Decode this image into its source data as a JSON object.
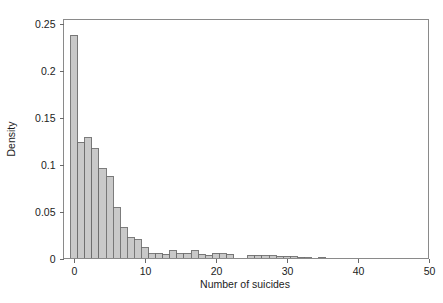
{
  "chart_data": {
    "type": "bar",
    "title": "",
    "subtitle": "",
    "xlabel": "Number of suicides",
    "ylabel": "Density",
    "xlim": [
      -1.5,
      50
    ],
    "ylim": [
      0,
      0.255
    ],
    "xticks": [
      0,
      10,
      20,
      30,
      40,
      50
    ],
    "xtick_labels": [
      "0",
      "10",
      "20",
      "30",
      "40",
      "50"
    ],
    "yticks": [
      0,
      0.05,
      0.1,
      0.15,
      0.2,
      0.25
    ],
    "ytick_labels": [
      "0",
      "0.05",
      "0.1",
      "0.15",
      "0.2",
      "0.25"
    ],
    "grid": false,
    "legend": null,
    "bin_width": 1,
    "bar_fill": "#c9c9c9",
    "bar_stroke": "#6e6e6e",
    "frame_color": "#8a8a8a",
    "categories": [
      0,
      1,
      2,
      3,
      4,
      5,
      6,
      7,
      8,
      9,
      10,
      11,
      12,
      13,
      14,
      15,
      16,
      17,
      18,
      19,
      20,
      21,
      22,
      23,
      24,
      25,
      26,
      27,
      28,
      29,
      30,
      31,
      32,
      33,
      34,
      35,
      36
    ],
    "values": [
      0.238,
      0.124,
      0.129,
      0.117,
      0.096,
      0.088,
      0.054,
      0.033,
      0.022,
      0.02,
      0.0115,
      0.005,
      0.0055,
      0.0045,
      0.0085,
      0.005,
      0.0055,
      0.0085,
      0.0045,
      0.0035,
      0.0055,
      0.005,
      0.0045,
      0.0,
      0.0,
      0.0035,
      0.0035,
      0.003,
      0.003,
      0.0025,
      0.0025,
      0.002,
      0.0015,
      0.001,
      0.0,
      0.0015,
      0.0
    ],
    "series": [
      {
        "name": "Density",
        "values": [
          0.238,
          0.124,
          0.129,
          0.117,
          0.096,
          0.088,
          0.054,
          0.033,
          0.022,
          0.02,
          0.0115,
          0.005,
          0.0055,
          0.0045,
          0.0085,
          0.005,
          0.0055,
          0.0085,
          0.0045,
          0.0035,
          0.0055,
          0.005,
          0.0045,
          0.0,
          0.0,
          0.0035,
          0.0035,
          0.003,
          0.003,
          0.0025,
          0.0025,
          0.002,
          0.0015,
          0.001,
          0.0,
          0.0015,
          0.0
        ]
      }
    ]
  }
}
